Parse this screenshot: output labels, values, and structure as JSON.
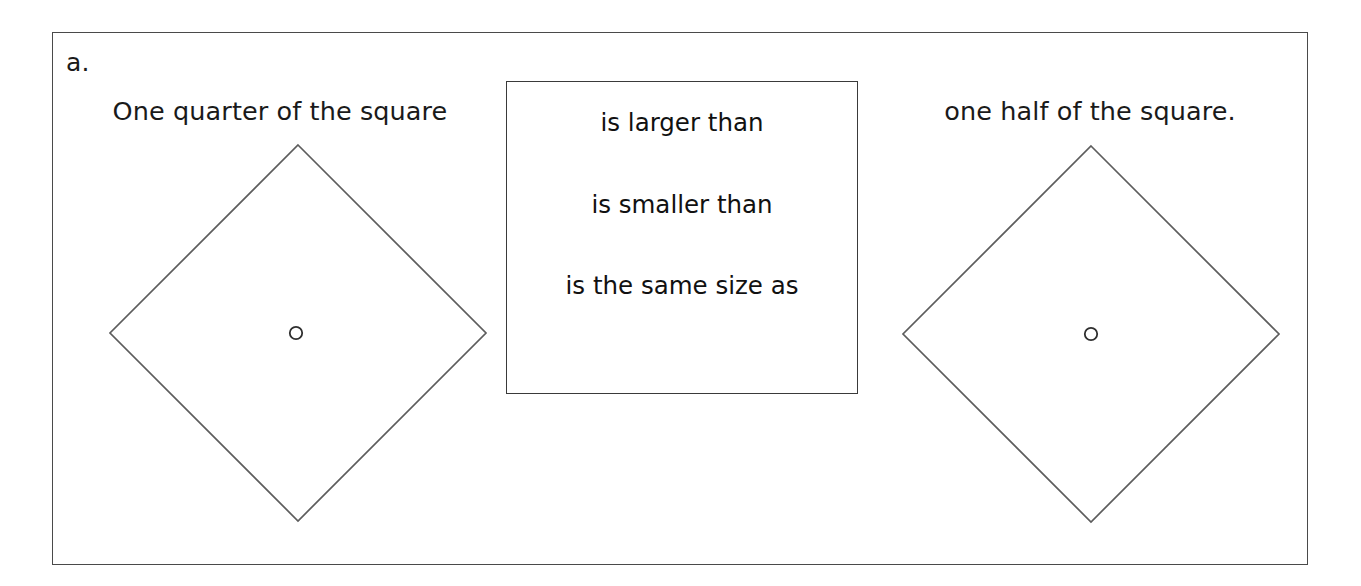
{
  "worksheet": {
    "item_letter": "a.",
    "left_phrase": "One quarter of the square",
    "right_phrase": "one half of the square.",
    "choice_box": {
      "options": [
        "is larger than",
        "is smaller than",
        "is the same size as"
      ]
    },
    "figures": [
      {
        "name": "left-diamond",
        "shape": "square-rotated-45",
        "shaded": "none",
        "center_marker": "small-open-circle"
      },
      {
        "name": "right-diamond",
        "shape": "square-rotated-45",
        "shaded": "none",
        "center_marker": "small-open-circle"
      }
    ],
    "colors": {
      "frame_stroke": "#4a4a4a",
      "box_stroke": "#3a3a3a",
      "figure_stroke": "#5d5d5d",
      "marker_stroke": "#2e2e2e",
      "text": "#1a1a1a",
      "background": "#ffffff"
    }
  }
}
